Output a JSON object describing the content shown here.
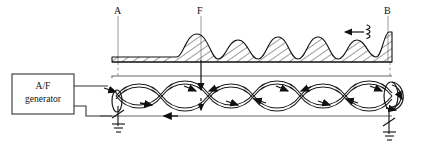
{
  "figure": {
    "type": "standing-wave-transmission-line-diagram",
    "background_color": "#ffffff",
    "line_color": "#1a1a1a",
    "guide_color": "#8a8a8a",
    "hatch_color": "#222222"
  },
  "source_block": {
    "name": "A/F generator",
    "line1": "A/F",
    "line2": "generator",
    "x": 12,
    "y": 74,
    "width": 62,
    "height": 40
  },
  "markers": [
    {
      "id": "A",
      "label": "A",
      "x": 118,
      "label_x": 114,
      "label_y": 8,
      "line_top": 16,
      "line_bottom": 108
    },
    {
      "id": "F",
      "label": "F",
      "x": 201,
      "label_x": 197,
      "label_y": 8,
      "line_top": 16,
      "line_bottom": 108
    },
    {
      "id": "B",
      "label": "B",
      "x": 388,
      "label_x": 384,
      "label_y": 8,
      "line_top": 16,
      "line_bottom": 108
    }
  ],
  "wave_direction": {
    "name": "incident-wave-direction",
    "arrow_label": "",
    "arrow_x_start": 363,
    "arrow_x_end": 344,
    "arrow_y": 32,
    "squiggle_x": 368,
    "squiggle_y": 32
  },
  "envelope": {
    "name": "amplitude-envelope",
    "baseline_y": 62,
    "flat_section_from_x": 112,
    "flat_section_to_x": 177,
    "flat_height": 5,
    "peaks": [
      {
        "center_x": 197,
        "height": 28,
        "half_width": 22
      },
      {
        "center_x": 238,
        "height": 22,
        "half_width": 20
      },
      {
        "center_x": 278,
        "height": 25,
        "half_width": 20
      },
      {
        "center_x": 318,
        "height": 25,
        "half_width": 20
      },
      {
        "center_x": 357,
        "height": 22,
        "half_width": 19
      },
      {
        "center_x": 389,
        "height": 30,
        "half_width": 13
      }
    ],
    "hatch_angle_deg": 55
  },
  "transmission_line": {
    "name": "twin-lead-line",
    "top_rail_y": 76,
    "bottom_rail_y": 116,
    "left_x": 112,
    "right_x": 392,
    "node_count": 7,
    "lobe_count": 6,
    "node_positions": [
      116,
      162,
      208,
      254,
      300,
      346,
      392
    ],
    "axis_y": 96
  },
  "current_arrows": [
    {
      "x": 146,
      "y": 104,
      "dir": "right"
    },
    {
      "x": 186,
      "y": 88,
      "dir": "right"
    },
    {
      "x": 196,
      "y": 88,
      "dir": "left"
    },
    {
      "x": 232,
      "y": 104,
      "dir": "right"
    },
    {
      "x": 242,
      "y": 104,
      "dir": "left"
    },
    {
      "x": 278,
      "y": 88,
      "dir": "right"
    },
    {
      "x": 288,
      "y": 88,
      "dir": "left"
    },
    {
      "x": 324,
      "y": 104,
      "dir": "right"
    },
    {
      "x": 334,
      "y": 104,
      "dir": "left"
    },
    {
      "x": 378,
      "y": 88,
      "dir": "right"
    },
    {
      "x": 167,
      "y": 116,
      "dir": "left"
    },
    {
      "x": 118,
      "y": 84,
      "dir": "right"
    }
  ],
  "f_pointer": {
    "name": "f-node-pointer",
    "x": 201,
    "from_y": 62,
    "to_y": 110
  },
  "grounds": [
    {
      "name": "ground-left",
      "x": 120,
      "top_y": 106,
      "symbol": "chassis-ground-with-slash"
    },
    {
      "name": "ground-right",
      "x": 389,
      "top_y": 118,
      "symbol": "chassis-ground-with-slash"
    }
  ],
  "end_loops": [
    {
      "name": "left-end-loop",
      "cx": 117,
      "cy": 100,
      "rx": 5,
      "ry": 12
    },
    {
      "name": "right-end-loop",
      "cx": 392,
      "cy": 96,
      "rx": 7,
      "ry": 14
    }
  ]
}
